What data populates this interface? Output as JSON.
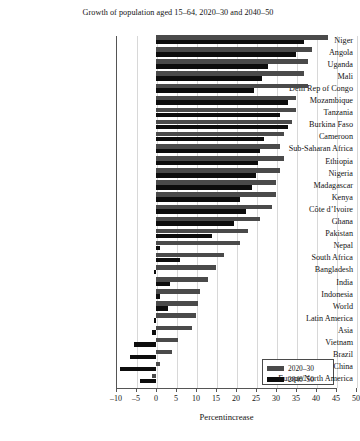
{
  "chart_data": {
    "type": "bar",
    "orientation": "horizontal",
    "title": "Growth of population aged 15–64, 2020–30 and 2040–50",
    "xlabel": "Percentincrease",
    "ylabel": "",
    "xlim": [
      -12,
      52
    ],
    "xticks": [
      -10,
      -5,
      0,
      5,
      10,
      15,
      20,
      25,
      30,
      35,
      40,
      45,
      50
    ],
    "xtick_labels": [
      "–10",
      "–5",
      "0",
      "5",
      "10",
      "15",
      "20",
      "25",
      "30",
      "35",
      "40",
      "45",
      "50"
    ],
    "grid": true,
    "grid_axis": "x",
    "legend_position": "bottom-right",
    "categories": [
      "Niger",
      "Angola",
      "Uganda",
      "Mali",
      "Dem Rep of Congo",
      "Mozambique",
      "Tanzania",
      "Burkina Faso",
      "Cameroon",
      "Sub-Saharan Africa",
      "Ethiopia",
      "Nigeria",
      "Madagascar",
      "Kenya",
      "Côte d’Ivoire",
      "Ghana",
      "Pakistan",
      "Nepal",
      "South Africa",
      "Bangladesh",
      "India",
      "Indonesia",
      "World",
      "Latin America",
      "Asia",
      "Vietnam",
      "Brazil",
      "China",
      "Europe/North America"
    ],
    "series": [
      {
        "name": "2020–30",
        "color": "#4a4a4a",
        "values": [
          43.0,
          39.0,
          38.0,
          37.0,
          38.0,
          35.0,
          35.0,
          34.0,
          32.0,
          31.0,
          32.0,
          31.0,
          30.0,
          30.0,
          29.0,
          26.0,
          23.0,
          21.0,
          17.0,
          15.0,
          13.0,
          11.0,
          10.5,
          10.0,
          9.0,
          5.5,
          4.0,
          1.0,
          -1.0
        ]
      },
      {
        "name": "2040–50",
        "color": "#0d0d0d",
        "values": [
          37.0,
          35.0,
          28.0,
          26.5,
          24.5,
          33.0,
          31.0,
          33.0,
          27.0,
          26.0,
          25.5,
          25.0,
          24.0,
          21.0,
          22.5,
          19.5,
          14.0,
          1.0,
          6.0,
          -0.5,
          3.5,
          1.0,
          3.0,
          -0.5,
          -1.0,
          -5.5,
          -6.5,
          -9.0,
          -4.0
        ]
      }
    ],
    "legend": [
      {
        "label": "2020–30",
        "color": "#4a4a4a"
      },
      {
        "label": "2040–50",
        "color": "#0d0d0d"
      }
    ]
  }
}
